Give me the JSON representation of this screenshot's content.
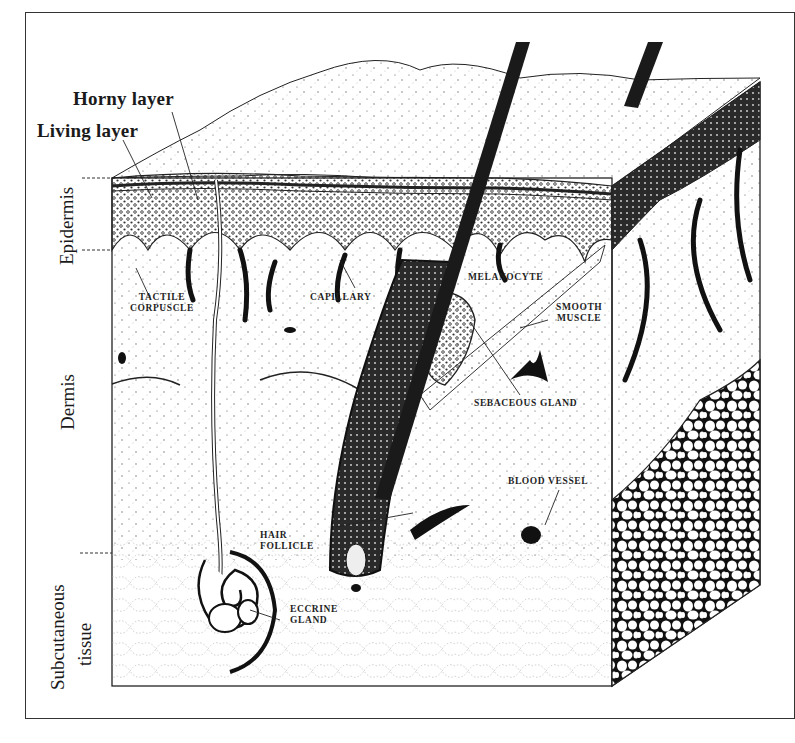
{
  "figure": {
    "top_labels": {
      "horny_layer": "Horny layer",
      "living_layer": "Living layer"
    },
    "side_labels": {
      "epidermis": "Epidermis",
      "dermis": "Dermis",
      "subcutaneous_line1": "Subcutaneous",
      "subcutaneous_line2": "tissue"
    },
    "structure_labels": {
      "tactile_line1": "TACTILE",
      "tactile_line2": "CORPUSCLE",
      "capillary": "CAPILLARY",
      "melanocyte": "MELANOCYTE",
      "smooth_line1": "SMOOTH",
      "smooth_line2": "MUSCLE",
      "sebaceous_gland": "SEBACEOUS GLAND",
      "blood_vessel": "BLOOD VESSEL",
      "hair_line1": "HAIR",
      "hair_line2": "FOLLICLE",
      "eccrine_line1": "ECCRINE",
      "eccrine_line2": "GLAND"
    },
    "colors": {
      "ink": "#1a1a1a",
      "paper": "#ffffff",
      "frame": "#333333"
    }
  }
}
